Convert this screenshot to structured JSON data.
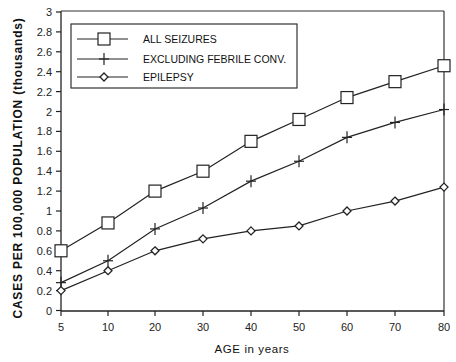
{
  "chart_data": {
    "type": "line",
    "title": "",
    "xlabel": "AGE in years",
    "ylabel": "CASES PER 100,000 POPULATION (thousands)",
    "x": [
      5,
      10,
      20,
      30,
      40,
      50,
      60,
      70,
      80
    ],
    "x_tick_labels": [
      "5",
      "10",
      "20",
      "30",
      "40",
      "50",
      "60",
      "70",
      "80"
    ],
    "y_tick_labels": [
      "0",
      "0.2",
      "0.4",
      "0.6",
      "0.8",
      "1",
      "1.2",
      "1.4",
      "1.6",
      "1.8",
      "2",
      "2.2",
      "2.4",
      "2.6",
      "2.8",
      "3"
    ],
    "ylim": [
      0,
      3
    ],
    "grid": false,
    "legend_position": "upper left (boxed)",
    "series": [
      {
        "name": "ALL SEIZURES",
        "marker": "square",
        "values": [
          0.6,
          0.88,
          1.2,
          1.4,
          1.7,
          1.92,
          2.14,
          2.3,
          2.46
        ]
      },
      {
        "name": "EXCLUDING FEBRILE CONV.",
        "marker": "plus",
        "values": [
          0.28,
          0.5,
          0.82,
          1.03,
          1.3,
          1.5,
          1.74,
          1.89,
          2.02
        ]
      },
      {
        "name": "EPILEPSY",
        "marker": "diamond",
        "values": [
          0.2,
          0.4,
          0.6,
          0.72,
          0.8,
          0.85,
          1.0,
          1.1,
          1.24
        ]
      }
    ]
  },
  "colors": {
    "line": "#222222",
    "background": "#ffffff"
  }
}
